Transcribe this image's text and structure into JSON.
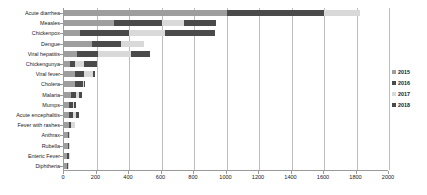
{
  "chart_data": {
    "type": "bar",
    "orientation": "horizontal",
    "stacked": true,
    "title": "",
    "xlabel": "",
    "ylabel": "",
    "xlim": [
      0,
      2000
    ],
    "xticks": [
      0,
      200,
      400,
      600,
      800,
      1000,
      1200,
      1400,
      1600,
      1800,
      2000
    ],
    "grid": true,
    "legend_position": "right",
    "categories": [
      "Acute diarrhea",
      "Measles",
      "Chickenpox",
      "Dengue",
      "Viral hepatitis",
      "Chickengunya",
      "Viral fever",
      "Cholera",
      "Malaria",
      "Mumps",
      "Acute encephalitis",
      "Fever with rashes",
      "Anthrax",
      "Rubella",
      "Enteric Fever",
      "Diphtheria"
    ],
    "series": [
      {
        "name": "2015",
        "color": "#9e9e9e",
        "values": [
          1000,
          310,
          100,
          170,
          80,
          35,
          70,
          70,
          42,
          32,
          30,
          30,
          22,
          22,
          20,
          18
        ]
      },
      {
        "name": "2016",
        "color": "#4a4a4a",
        "values": [
          600,
          290,
          300,
          180,
          130,
          35,
          55,
          45,
          30,
          22,
          24,
          16,
          8,
          8,
          8,
          8
        ]
      },
      {
        "name": "2017",
        "color": "#d9d9d9",
        "values": [
          220,
          140,
          220,
          145,
          200,
          55,
          55,
          10,
          18,
          10,
          20,
          22,
          8,
          6,
          6,
          6
        ]
      },
      {
        "name": "2018",
        "color": "#4a4a4a",
        "values": [
          0,
          195,
          310,
          0,
          120,
          75,
          10,
          6,
          18,
          8,
          18,
          0,
          0,
          0,
          0,
          0
        ]
      }
    ]
  },
  "legend": {
    "entries": [
      {
        "label": "2015",
        "color": "#9e9e9e"
      },
      {
        "label": "2016",
        "color": "#4a4a4a"
      },
      {
        "label": "2017",
        "color": "#d9d9d9"
      },
      {
        "label": "2018",
        "color": "#4a4a4a"
      }
    ]
  },
  "axis": {
    "x_tick_labels": [
      "0",
      "200",
      "400",
      "600",
      "800",
      "1000",
      "1200",
      "1400",
      "1600",
      "1800",
      "2000"
    ]
  }
}
